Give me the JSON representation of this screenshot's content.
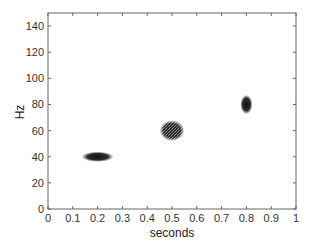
{
  "chart_data": {
    "type": "heatmap",
    "title": "",
    "xlabel": "seconds",
    "ylabel": "Hz",
    "xlim": [
      0,
      1
    ],
    "ylim": [
      0,
      150
    ],
    "grid": false,
    "legend": null,
    "x_ticks": [
      0,
      0.1,
      0.2,
      0.3,
      0.4,
      0.5,
      0.6,
      0.7,
      0.8,
      0.9,
      1
    ],
    "x_tick_labels": [
      "0",
      "0.1",
      "0.2",
      "0.3",
      "0.4",
      "0.5",
      "0.6",
      "0.7",
      "0.8",
      "0.9",
      "1"
    ],
    "y_ticks": [
      0,
      20,
      40,
      60,
      80,
      100,
      120,
      140
    ],
    "y_tick_labels": [
      "0",
      "20",
      "40",
      "60",
      "80",
      "100",
      "120",
      "140"
    ],
    "series": [
      {
        "name": "atom-1",
        "time_center": 0.2,
        "freq_center": 40,
        "time_width": 0.13,
        "freq_width": 8,
        "shape": "horizontal-ellipse"
      },
      {
        "name": "atom-2",
        "time_center": 0.5,
        "freq_center": 60,
        "time_width": 0.1,
        "freq_width": 16,
        "shape": "round-speckled"
      },
      {
        "name": "atom-3",
        "time_center": 0.8,
        "freq_center": 80,
        "time_width": 0.05,
        "freq_width": 15,
        "shape": "vertical-ellipse"
      }
    ]
  },
  "colors": {
    "background": "#ffffff",
    "axis": "#666666",
    "blob": "#1a1a1a"
  }
}
